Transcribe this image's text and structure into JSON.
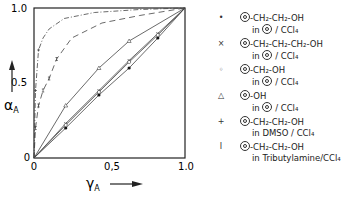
{
  "chart_data": {
    "type": "line",
    "title": "",
    "xlabel": "γA",
    "ylabel": "αA",
    "xlim": [
      0,
      1.0
    ],
    "ylim": [
      0,
      1.0
    ],
    "x_ticks": [
      "0",
      "0,5",
      "1.0"
    ],
    "y_ticks": [
      "0",
      "0.5",
      "1.0"
    ],
    "grid": false,
    "legend_position": "right",
    "series": [
      {
        "name": "Ph-CH2-CH2-OH in Ph / CCl4",
        "marker": "filled-circle",
        "style": "solid",
        "x": [
          0,
          0.21,
          0.43,
          0.63,
          0.82,
          1.0
        ],
        "y": [
          0,
          0.2,
          0.42,
          0.6,
          0.8,
          1.0
        ]
      },
      {
        "name": "Ph-CH2-CH2-CH2-OH in Ph / CCl4",
        "marker": "x",
        "style": "solid",
        "x": [
          0,
          0.21,
          0.43,
          0.63,
          0.82,
          1.0
        ],
        "y": [
          0,
          0.23,
          0.45,
          0.65,
          0.83,
          1.0
        ]
      },
      {
        "name": "Ph-CH2-OH in Ph / CCl4",
        "marker": "open-circle",
        "style": "solid",
        "x": [
          0,
          0.21,
          0.43,
          0.63,
          0.82,
          1.0
        ],
        "y": [
          0,
          0.22,
          0.44,
          0.64,
          0.82,
          1.0
        ]
      },
      {
        "name": "Ph-OH in Ph / CCl4",
        "marker": "triangle",
        "style": "solid",
        "x": [
          0,
          0.21,
          0.43,
          0.63,
          1.0
        ],
        "y": [
          0,
          0.35,
          0.6,
          0.78,
          1.0
        ]
      },
      {
        "name": "Ph-CH2-CH2-OH in DMSO / CCl4",
        "marker": "plus",
        "style": "dash-dot",
        "x": [
          0,
          0.01,
          0.03,
          0.06,
          0.1,
          0.2,
          0.4,
          0.7,
          1.0
        ],
        "y": [
          0,
          0.45,
          0.72,
          0.8,
          0.86,
          0.93,
          0.97,
          0.99,
          1.0
        ]
      },
      {
        "name": "Ph-CH2-CH2-OH in Tributylamine/CCl4",
        "marker": "I-bar",
        "style": "dashed",
        "x": [
          0,
          0.01,
          0.03,
          0.06,
          0.1,
          0.15,
          0.25,
          0.45,
          0.7,
          1.0
        ],
        "y": [
          0,
          0.2,
          0.35,
          0.45,
          0.53,
          0.66,
          0.8,
          0.9,
          0.95,
          1.0
        ]
      }
    ]
  },
  "axes": {
    "x_label": "γ",
    "x_sub": "A",
    "y_label": "α",
    "y_sub": "A",
    "x_ticks": [
      "0",
      "0,5",
      "1.0"
    ],
    "y_ticks": [
      "0",
      "0.5",
      "1.0"
    ]
  },
  "legend": [
    {
      "marker": "•",
      "line1": "-CH₂-CH₂-OH",
      "line2_pre": "in",
      "line2_post": "/ CCl₄",
      "ring2": true
    },
    {
      "marker": "×",
      "line1": "-CH₂-CH₂-CH₂-OH",
      "line2_pre": "in",
      "line2_post": "/ CCl₄",
      "ring2": true
    },
    {
      "marker": "◦",
      "line1": "-CH₂-OH",
      "line2_pre": "in",
      "line2_post": "/ CCl₄",
      "ring2": true
    },
    {
      "marker": "△",
      "line1": "-OH",
      "line2_pre": "in",
      "line2_post": "/ CCl₄",
      "ring2": true
    },
    {
      "marker": "+",
      "line1": "-CH₂-CH₂-OH",
      "line2_pre": "in DMSO / CCl₄",
      "line2_post": "",
      "ring2": false
    },
    {
      "marker": "I",
      "line1": "-CH₂-CH₂-OH",
      "line2_pre": "in Tributylamine/CCl₄",
      "line2_post": "",
      "ring2": false
    }
  ]
}
